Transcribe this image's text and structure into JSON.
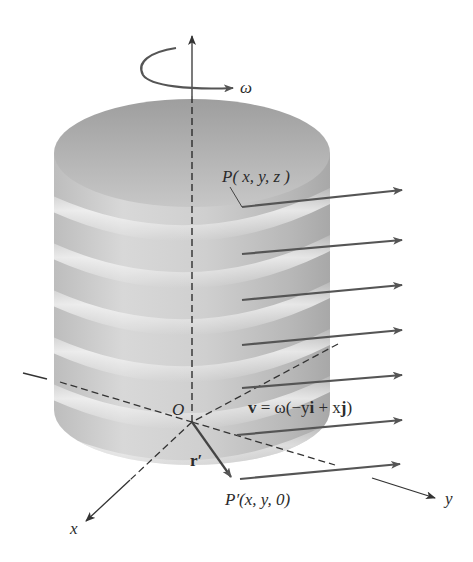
{
  "figure": {
    "colors": {
      "background": "#ffffff",
      "cylinder_light": "#ececec",
      "cylinder_mid": "#c4c4c4",
      "cylinder_dark": "#a9a9a9",
      "top_face": "#b3b3b3",
      "arrow": "#555555",
      "axis": "#333333",
      "text": "#2b2b2b"
    },
    "labels": {
      "omega": "ω",
      "point_P": "P( x, y, z )",
      "origin": "O",
      "velocity_lhs": "v",
      "velocity_eq": " = ω(−y",
      "velocity_i": "i",
      "velocity_mid": " + x",
      "velocity_j": "j",
      "velocity_close": ")",
      "r_prime": "r′",
      "point_P_prime": "P′(x, y, 0)",
      "axis_x": "x",
      "axis_y": "y"
    },
    "velocity_arrows_count": 7
  }
}
